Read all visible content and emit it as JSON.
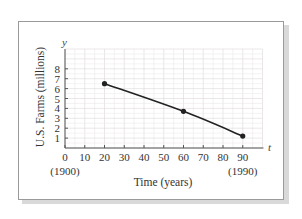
{
  "chart_data": {
    "type": "line",
    "title": "",
    "xlabel": "Time (years)",
    "ylabel": "U.S. Farms (millions)",
    "x_var": "t",
    "y_var": "y",
    "x_ticks": [
      0,
      10,
      20,
      30,
      40,
      50,
      60,
      70,
      80,
      90
    ],
    "x_tick_labels": [
      "0",
      "10",
      "20",
      "30",
      "40",
      "50",
      "60",
      "70",
      "80",
      "90"
    ],
    "x_sub_labels": [
      {
        "x": 0,
        "label": "(1900)"
      },
      {
        "x": 90,
        "label": "(1990)"
      }
    ],
    "y_ticks": [
      1,
      2,
      3,
      4,
      5,
      6,
      7,
      8
    ],
    "y_tick_labels": [
      "1",
      "2",
      "3",
      "4",
      "5",
      "6",
      "7",
      "8"
    ],
    "xlim": [
      0,
      100
    ],
    "ylim": [
      0,
      10
    ],
    "grid": true,
    "series": [
      {
        "name": "U.S. Farms",
        "x": [
          20,
          60,
          90
        ],
        "values": [
          6.5,
          3.7,
          1.2
        ],
        "markers": true,
        "smooth": true
      }
    ]
  },
  "colors": {
    "curve": "#222222",
    "grid": "#e6dede",
    "axis": "#555555",
    "frame": "#9a9a9a"
  }
}
